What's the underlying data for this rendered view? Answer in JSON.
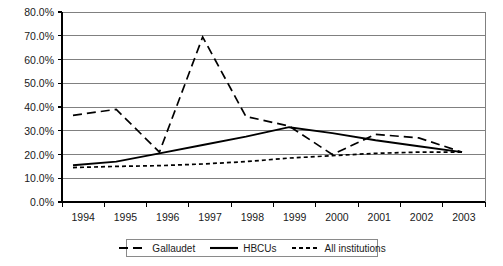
{
  "chart_data": {
    "type": "line",
    "title": "",
    "subtitle": "",
    "xlabel": "",
    "ylabel": "",
    "categories": [
      "1994",
      "1995",
      "1996",
      "1997",
      "1998",
      "1999",
      "2000",
      "2001",
      "2002",
      "2003"
    ],
    "x": [
      1994,
      1995,
      1996,
      1997,
      1998,
      1999,
      2000,
      2001,
      2002,
      2003
    ],
    "ylim": [
      0,
      80
    ],
    "xlim": [
      1994,
      2003
    ],
    "grid": true,
    "grid_axis": "y",
    "legend_position": "bottom",
    "y_tick_labels": [
      "0.0%",
      "10.0%",
      "20.0%",
      "30.0%",
      "40.0%",
      "50.0%",
      "60.0%",
      "70.0%",
      "80.0%"
    ],
    "y_tick_values": [
      0,
      10,
      20,
      30,
      40,
      50,
      60,
      70,
      80
    ],
    "series": [
      {
        "name": "Gallaudet",
        "style": "long-dash",
        "color": "#000000",
        "values": [
          36.5,
          39.0,
          21.0,
          69.5,
          36.0,
          32.0,
          20.0,
          28.5,
          27.0,
          21.0
        ]
      },
      {
        "name": "HBCUs",
        "style": "solid",
        "color": "#000000",
        "values": [
          15.5,
          17.0,
          20.5,
          24.0,
          27.5,
          31.5,
          29.0,
          26.0,
          23.5,
          21.0
        ]
      },
      {
        "name": "All institutions",
        "style": "short-dash",
        "color": "#000000",
        "values": [
          14.5,
          15.0,
          15.3,
          16.0,
          17.0,
          18.5,
          19.5,
          20.5,
          21.0,
          21.0
        ]
      }
    ]
  },
  "legend": {
    "items": [
      {
        "label": "Gallaudet"
      },
      {
        "label": "HBCUs"
      },
      {
        "label": "All institutions"
      }
    ]
  },
  "colors": {
    "axis": "#000000",
    "gridline": "#808080",
    "plot_background": "#ffffff",
    "text": "#1a1a1a"
  }
}
